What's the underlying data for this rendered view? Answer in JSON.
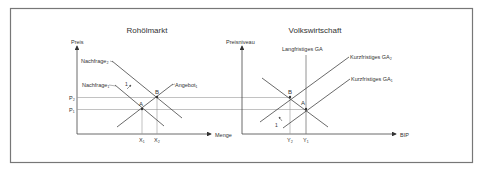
{
  "left_chart": {
    "title": "Rohölmarkt",
    "y_axis_label": "Preis",
    "x_axis_label": "Menge",
    "demand2_label": "Nachfrage₂",
    "demand1_label": "Nachfrage₁",
    "supply_label": "Angebot₁",
    "shift_label": "1",
    "point_a": "A",
    "point_b": "B",
    "p2_label": "P₂",
    "p1_label": "P₁",
    "x1_label": "X₁",
    "x2_label": "X₂"
  },
  "right_chart": {
    "title": "Volkswirtschaft",
    "y_axis_label": "Preisniveau",
    "x_axis_label": "BIP",
    "lras_label": "Langfristiges GA",
    "sras2_label": "Kurzfristiges GA₂",
    "sras1_label": "Kurzfristiges GA₁",
    "shift_label": "1",
    "point_a": "A",
    "point_b": "B",
    "y2_label": "Y₂",
    "y1_label": "Y₁"
  },
  "colors": {
    "line": "#555555",
    "guide": "#888888",
    "border": "#777777"
  }
}
